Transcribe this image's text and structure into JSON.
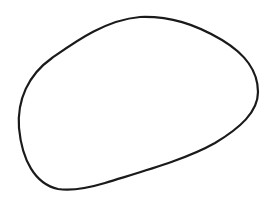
{
  "drawing": {
    "shape": "hand-drawn oval outline",
    "stroke_color": "#1a1a1a",
    "background_color": "#ffffff",
    "stroke_width": 2.2
  }
}
